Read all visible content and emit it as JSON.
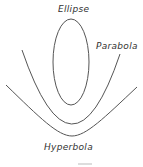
{
  "diagram": {
    "labels": {
      "ellipse": "Ellipse",
      "parabola": "Parabola",
      "hyperbola": "Hyperbola"
    },
    "stroke_color": "#555555"
  }
}
